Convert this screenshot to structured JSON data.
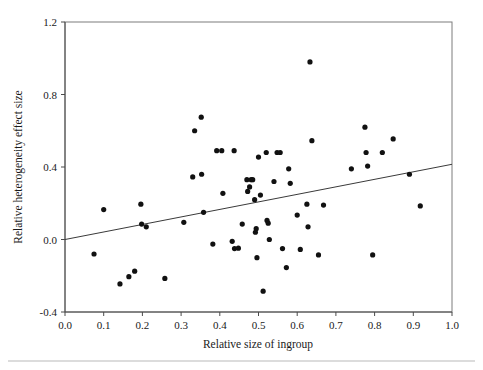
{
  "chart_data": {
    "type": "scatter",
    "title": "",
    "xlabel": "Relative size of ingroup",
    "ylabel": "Relative heterogeneity effect size",
    "xlim": [
      0.0,
      1.0
    ],
    "ylim": [
      -0.4,
      1.2
    ],
    "xticks": [
      "0.0",
      "0.1",
      "0.2",
      "0.3",
      "0.4",
      "0.5",
      "0.6",
      "0.7",
      "0.8",
      "0.9",
      "1.0"
    ],
    "xtick_values": [
      0.0,
      0.1,
      0.2,
      0.3,
      0.4,
      0.5,
      0.6,
      0.7,
      0.8,
      0.9,
      1.0
    ],
    "yticks": [
      "1.2",
      "0.8",
      "0.4",
      "0.0",
      "-0.4"
    ],
    "ytick_values": [
      1.2,
      0.8,
      0.4,
      0.0,
      -0.4
    ],
    "grid": false,
    "legend": false,
    "marker": "filled-circle",
    "marker_color": "#111111",
    "point_count": 76,
    "points": [
      [
        0.075,
        -0.08
      ],
      [
        0.1,
        0.165
      ],
      [
        0.142,
        -0.245
      ],
      [
        0.165,
        -0.205
      ],
      [
        0.18,
        -0.175
      ],
      [
        0.196,
        0.195
      ],
      [
        0.198,
        0.085
      ],
      [
        0.21,
        0.07
      ],
      [
        0.258,
        -0.215
      ],
      [
        0.307,
        0.095
      ],
      [
        0.33,
        0.345
      ],
      [
        0.335,
        0.6
      ],
      [
        0.352,
        0.675
      ],
      [
        0.353,
        0.36
      ],
      [
        0.358,
        0.15
      ],
      [
        0.382,
        -0.025
      ],
      [
        0.392,
        0.49
      ],
      [
        0.405,
        0.49
      ],
      [
        0.408,
        0.255
      ],
      [
        0.432,
        -0.01
      ],
      [
        0.437,
        0.49
      ],
      [
        0.438,
        -0.05
      ],
      [
        0.448,
        -0.048
      ],
      [
        0.458,
        0.085
      ],
      [
        0.47,
        0.33
      ],
      [
        0.472,
        0.265
      ],
      [
        0.477,
        0.29
      ],
      [
        0.481,
        0.33
      ],
      [
        0.485,
        0.33
      ],
      [
        0.49,
        0.22
      ],
      [
        0.492,
        0.04
      ],
      [
        0.494,
        0.06
      ],
      [
        0.496,
        -0.1
      ],
      [
        0.5,
        0.455
      ],
      [
        0.505,
        0.245
      ],
      [
        0.512,
        -0.285
      ],
      [
        0.52,
        0.48
      ],
      [
        0.522,
        0.105
      ],
      [
        0.525,
        0.09
      ],
      [
        0.528,
        0.0
      ],
      [
        0.54,
        0.32
      ],
      [
        0.548,
        0.48
      ],
      [
        0.556,
        0.48
      ],
      [
        0.562,
        -0.05
      ],
      [
        0.572,
        -0.155
      ],
      [
        0.578,
        0.39
      ],
      [
        0.582,
        0.31
      ],
      [
        0.6,
        0.135
      ],
      [
        0.608,
        -0.055
      ],
      [
        0.625,
        0.195
      ],
      [
        0.628,
        0.07
      ],
      [
        0.633,
        0.98
      ],
      [
        0.638,
        0.545
      ],
      [
        0.655,
        -0.085
      ],
      [
        0.668,
        0.19
      ],
      [
        0.74,
        0.39
      ],
      [
        0.775,
        0.62
      ],
      [
        0.778,
        0.48
      ],
      [
        0.782,
        0.405
      ],
      [
        0.795,
        -0.085
      ],
      [
        0.82,
        0.48
      ],
      [
        0.848,
        0.555
      ],
      [
        0.89,
        0.36
      ],
      [
        0.918,
        0.185
      ]
    ],
    "fit_line": {
      "label": "regression line",
      "x": [
        0.0,
        1.0
      ],
      "y": [
        0.0,
        0.415
      ],
      "color": "#3a3a3a"
    }
  },
  "figure": {
    "background": "#ffffff",
    "frame_color": "#7c7c7c",
    "axis_color": "#4a4a4a"
  }
}
